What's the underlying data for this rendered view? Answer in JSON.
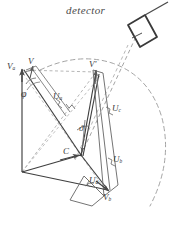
{
  "figure": {
    "title": "detector",
    "domain_type": "vector-phasor-diagram",
    "ink_color": "#4a4a4a",
    "dash_color": "#8a8a8a",
    "background": "#ffffff",
    "width": 175,
    "height": 233
  },
  "labels": {
    "detector": "detector",
    "v_apex": "V",
    "v_a": "V",
    "v_a_sub": "a",
    "v_prime": "V'",
    "v_b": "V",
    "v_b_sub": "b",
    "u_a": "U",
    "u_a_sub": "a",
    "u_b": "U",
    "u_b_sub": "b",
    "u_c": "U",
    "u_c_sub": "c",
    "u_d": "U",
    "u_d_sub": "d",
    "center": "C",
    "angle_phi": "φ",
    "angle_theta": "ϑ"
  },
  "elements": {
    "detector_bar": "tilted-rectangular-detector",
    "dashed_arc": "large-dashed-circular-arc",
    "beam_line": "dashed-beam-axis",
    "vector_network": "solid-vector-frame"
  }
}
